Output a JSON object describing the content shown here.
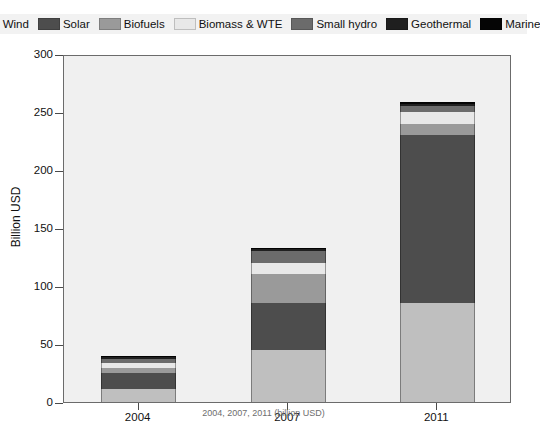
{
  "chart_data": {
    "type": "bar",
    "subtype": "stacked-vertical",
    "title": "",
    "xlabel": "",
    "ylabel": "Billion USD",
    "categories": [
      "2004",
      "2007",
      "2011"
    ],
    "ylim": [
      0,
      300
    ],
    "yticks": [
      0,
      50,
      100,
      150,
      200,
      250,
      300
    ],
    "ytick_labels": [
      "0",
      "50",
      "100",
      "150",
      "200",
      "250",
      "300"
    ],
    "grid": false,
    "legend_position": "top",
    "series": [
      {
        "name": "Wind",
        "color": "#bfbfbf",
        "values": [
          11,
          45,
          85
        ]
      },
      {
        "name": "Solar",
        "color": "#4d4d4d",
        "values": [
          14,
          40,
          145
        ]
      },
      {
        "name": "Biofuels",
        "color": "#9a9a9a",
        "values": [
          4,
          25,
          10
        ]
      },
      {
        "name": "Biomass & WTE",
        "color": "#e8e8e8",
        "values": [
          5,
          10,
          10
        ]
      },
      {
        "name": "Small hydro",
        "color": "#6b6b6b",
        "values": [
          3,
          10,
          5
        ]
      },
      {
        "name": "Geothermal",
        "color": "#1f1f1f",
        "values": [
          2,
          2,
          2
        ]
      },
      {
        "name": "Marine",
        "color": "#050505",
        "values": [
          1,
          1,
          2
        ]
      }
    ],
    "totals": [
      40,
      133,
      259
    ],
    "annotations": []
  },
  "legend": {
    "items": [
      {
        "label": "Wind",
        "color": "#bfbfbf"
      },
      {
        "label": "Solar",
        "color": "#4d4d4d"
      },
      {
        "label": "Biofuels",
        "color": "#9a9a9a"
      },
      {
        "label": "Biomass & WTE",
        "color": "#e8e8e8"
      },
      {
        "label": "Small hydro",
        "color": "#6b6b6b"
      },
      {
        "label": "Geothermal",
        "color": "#1f1f1f"
      },
      {
        "label": "Marine",
        "color": "#050505"
      }
    ]
  },
  "axis": {
    "y_title": "Billion USD"
  },
  "caption": {
    "text": "2004, 2007, 2011 (billion USD)"
  }
}
